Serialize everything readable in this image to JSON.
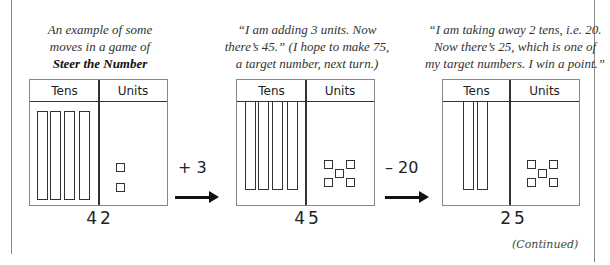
{
  "captions": {
    "intro_line1": "An example of some",
    "intro_line2": "moves in a game of",
    "intro_game": "Steer the Number",
    "step1_line1": "“I am adding 3 units. Now",
    "step1_line2": "there’s 45.” (I hope to make 75,",
    "step1_line3": "a target number, next turn.)",
    "step2_line1": "“I am taking away 2 tens, i.e. 20.",
    "step2_line2": "Now there’s 25, which is one of",
    "step2_line3": "my target numbers. I win a point.”"
  },
  "panels": [
    {
      "tens_label": "Tens",
      "units_label": "Units",
      "tens": 4,
      "units": 2,
      "total": "42"
    },
    {
      "tens_label": "Tens",
      "units_label": "Units",
      "tens": 4,
      "units": 5,
      "total": "45"
    },
    {
      "tens_label": "Tens",
      "units_label": "Units",
      "tens": 2,
      "units": 5,
      "total": "25"
    }
  ],
  "operations": [
    {
      "label": "+ 3",
      "icon": "right-arrow-icon"
    },
    {
      "label": "– 20",
      "icon": "right-arrow-icon"
    }
  ],
  "footer": {
    "continued": "(Continued)"
  }
}
